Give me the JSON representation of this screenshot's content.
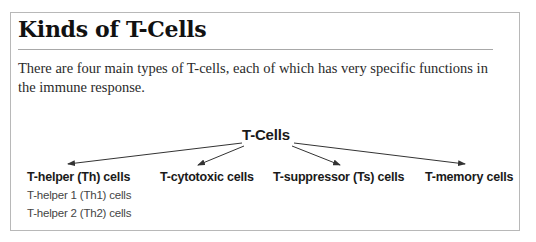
{
  "document": {
    "title": "Kinds of T-Cells",
    "intro": "There are four main types of T-cells, each of which has very specific functions in the immune response."
  },
  "diagram": {
    "root": "T-Cells",
    "children": [
      {
        "label": "T-helper (Th) cells",
        "subtypes": [
          "T-helper 1 (Th1) cells",
          "T-helper 2 (Th2) cells"
        ]
      },
      {
        "label": "T-cytotoxic cells",
        "subtypes": []
      },
      {
        "label": "T-suppressor (Ts) cells",
        "subtypes": []
      },
      {
        "label": "T-memory cells",
        "subtypes": []
      }
    ],
    "arrow_color": "#333333"
  }
}
